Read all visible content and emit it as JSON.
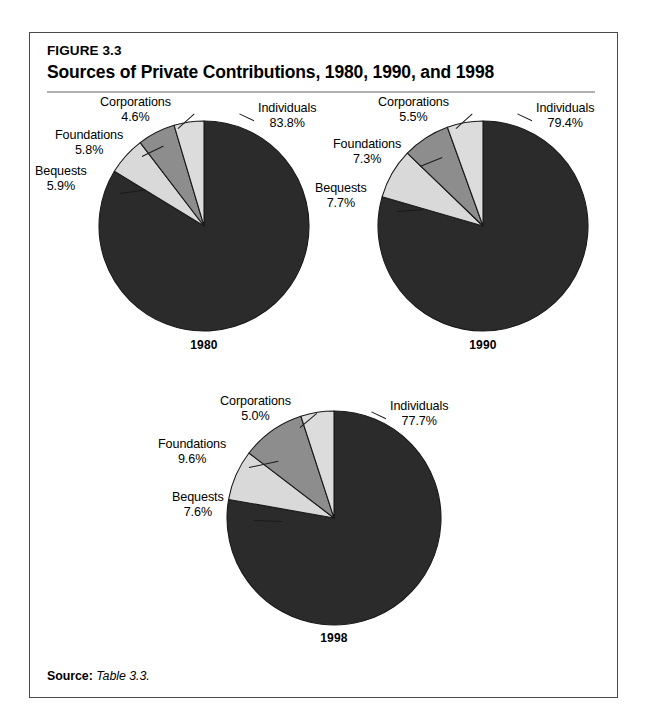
{
  "figure": {
    "number": "FIGURE 3.3",
    "title": "Sources of Private Contributions, 1980, 1990, and 1998",
    "source_label": "Source:",
    "source_value": "Table 3.3."
  },
  "colors": {
    "individuals": "#2b2b2b",
    "bequests": "#d9d9d9",
    "foundations": "#8d8d8d",
    "corporations": "#dcdcdc",
    "slice_outline": "#1b1b1b",
    "frame_border": "#4a4a4a",
    "title_rule": "#b0b0b0",
    "text": "#000000",
    "background": "#ffffff"
  },
  "chart_data": [
    {
      "type": "pie",
      "title": "1980",
      "labels": [
        "Individuals",
        "Bequests",
        "Foundations",
        "Corporations"
      ],
      "values": [
        83.8,
        5.9,
        5.8,
        4.6
      ],
      "value_labels": [
        "83.8%",
        "5.9%",
        "5.8%",
        "4.6%"
      ],
      "unit": "%",
      "legend": "none",
      "start_angle_deg": 0,
      "direction": "clockwise"
    },
    {
      "type": "pie",
      "title": "1990",
      "labels": [
        "Individuals",
        "Bequests",
        "Foundations",
        "Corporations"
      ],
      "values": [
        79.4,
        7.7,
        7.3,
        5.5
      ],
      "value_labels": [
        "79.4%",
        "7.7%",
        "7.3%",
        "5.5%"
      ],
      "unit": "%",
      "legend": "none",
      "start_angle_deg": 0,
      "direction": "clockwise"
    },
    {
      "type": "pie",
      "title": "1998",
      "labels": [
        "Individuals",
        "Bequests",
        "Foundations",
        "Corporations"
      ],
      "values": [
        77.7,
        7.6,
        9.6,
        5.0
      ],
      "value_labels": [
        "77.7%",
        "7.6%",
        "9.6%",
        "5.0%"
      ],
      "unit": "%",
      "legend": "none",
      "start_angle_deg": 0,
      "direction": "clockwise"
    }
  ],
  "pies": [
    {
      "year": "1980",
      "slices": [
        {
          "name": "Individuals",
          "value_label": "83.8%",
          "pct": 83.8
        },
        {
          "name": "Bequests",
          "value_label": "5.9%",
          "pct": 5.9
        },
        {
          "name": "Foundations",
          "value_label": "5.8%",
          "pct": 5.8
        },
        {
          "name": "Corporations",
          "value_label": "4.6%",
          "pct": 4.6
        }
      ]
    },
    {
      "year": "1990",
      "slices": [
        {
          "name": "Individuals",
          "value_label": "79.4%",
          "pct": 79.4
        },
        {
          "name": "Bequests",
          "value_label": "7.7%",
          "pct": 7.7
        },
        {
          "name": "Foundations",
          "value_label": "7.3%",
          "pct": 7.3
        },
        {
          "name": "Corporations",
          "value_label": "5.5%",
          "pct": 5.5
        }
      ]
    },
    {
      "year": "1998",
      "slices": [
        {
          "name": "Individuals",
          "value_label": "77.7%",
          "pct": 77.7
        },
        {
          "name": "Bequests",
          "value_label": "7.6%",
          "pct": 7.6
        },
        {
          "name": "Foundations",
          "value_label": "9.6%",
          "pct": 9.6
        },
        {
          "name": "Corporations",
          "value_label": "5.0%",
          "pct": 5.0
        }
      ]
    }
  ]
}
